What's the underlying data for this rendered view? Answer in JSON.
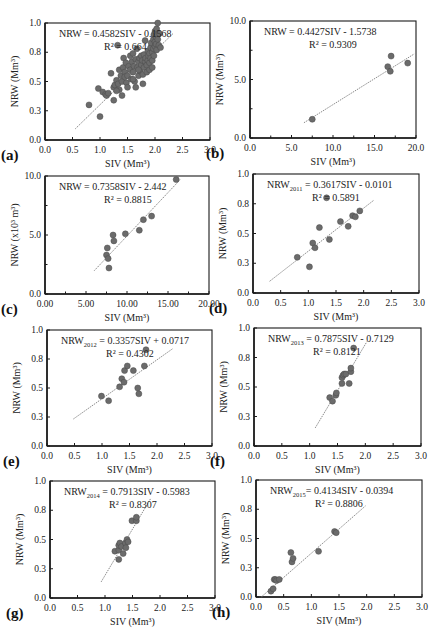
{
  "figure": {
    "style": {
      "point_fill": "#6b6b6b",
      "point_stroke": "#4a4a4a",
      "trend_color": "#8a8a8a",
      "axis_color": "#1a1a1a",
      "text_color": "#222222"
    }
  },
  "chart_data": [
    {
      "panel": "(a)",
      "type": "scatter",
      "title": "",
      "xlabel": "SIV (Mm³)",
      "ylabel": "NRW (Mm³)",
      "xlim": [
        0,
        3.0
      ],
      "ylim": [
        0,
        1.0
      ],
      "xticks": [
        "0.0",
        "0.5",
        "1.0",
        "1.5",
        "2.0",
        "2.5",
        "3.0"
      ],
      "yticks": [
        "0.0",
        "0.3",
        "0.5",
        "0.8",
        "1.0"
      ],
      "grid": false,
      "equation": {
        "lhs": "NRW",
        "sub": "",
        "rhs": " = 0.4582SIV - 0.1568"
      },
      "r2": "R² = 0.664",
      "trendline": {
        "slope": 0.4582,
        "intercept": -0.1568,
        "x_range": [
          0.55,
          2.33
        ]
      },
      "points": [
        [
          0.8,
          0.3
        ],
        [
          1.0,
          0.2
        ],
        [
          0.97,
          0.44
        ],
        [
          1.05,
          0.41
        ],
        [
          1.1,
          0.39
        ],
        [
          1.12,
          0.38
        ],
        [
          1.15,
          0.4
        ],
        [
          1.2,
          0.57
        ],
        [
          1.25,
          0.34
        ],
        [
          1.25,
          0.45
        ],
        [
          1.27,
          0.47
        ],
        [
          1.3,
          0.51
        ],
        [
          1.32,
          0.81
        ],
        [
          1.33,
          0.48
        ],
        [
          1.35,
          0.6
        ],
        [
          1.35,
          0.43
        ],
        [
          1.38,
          0.55
        ],
        [
          1.4,
          0.5
        ],
        [
          1.4,
          0.38
        ],
        [
          1.42,
          0.62
        ],
        [
          1.43,
          0.7
        ],
        [
          1.45,
          0.58
        ],
        [
          1.45,
          0.54
        ],
        [
          1.47,
          0.66
        ],
        [
          1.48,
          0.49
        ],
        [
          1.5,
          0.55
        ],
        [
          1.52,
          0.63
        ],
        [
          1.55,
          0.72
        ],
        [
          1.55,
          0.6
        ],
        [
          1.57,
          0.52
        ],
        [
          1.58,
          0.67
        ],
        [
          1.6,
          0.58
        ],
        [
          1.6,
          0.74
        ],
        [
          1.62,
          0.63
        ],
        [
          1.63,
          0.5
        ],
        [
          1.65,
          0.69
        ],
        [
          1.65,
          0.45
        ],
        [
          1.67,
          0.78
        ],
        [
          1.68,
          0.62
        ],
        [
          1.7,
          0.55
        ],
        [
          1.7,
          0.67
        ],
        [
          1.72,
          0.7
        ],
        [
          1.73,
          0.59
        ],
        [
          1.75,
          0.64
        ],
        [
          1.75,
          0.72
        ],
        [
          1.77,
          0.68
        ],
        [
          1.78,
          0.56
        ],
        [
          1.78,
          0.48
        ],
        [
          1.8,
          0.73
        ],
        [
          1.8,
          0.62
        ],
        [
          1.82,
          0.85
        ],
        [
          1.82,
          0.67
        ],
        [
          1.83,
          0.7
        ],
        [
          1.85,
          0.64
        ],
        [
          1.85,
          0.58
        ],
        [
          1.87,
          0.76
        ],
        [
          1.87,
          0.68
        ],
        [
          1.88,
          0.72
        ],
        [
          1.9,
          0.74
        ],
        [
          1.9,
          0.66
        ],
        [
          1.9,
          0.6
        ],
        [
          1.92,
          0.79
        ],
        [
          1.92,
          0.7
        ],
        [
          1.93,
          0.83
        ],
        [
          1.95,
          0.75
        ],
        [
          1.95,
          0.68
        ],
        [
          1.97,
          0.86
        ],
        [
          1.97,
          0.78
        ],
        [
          1.98,
          0.9
        ],
        [
          1.98,
          0.72
        ],
        [
          2.0,
          0.84
        ],
        [
          2.0,
          0.8
        ],
        [
          2.0,
          0.93
        ],
        [
          2.02,
          0.88
        ],
        [
          2.02,
          0.82
        ],
        [
          2.03,
          0.95
        ],
        [
          2.03,
          0.77
        ],
        [
          2.05,
          0.9
        ],
        [
          2.05,
          0.86
        ],
        [
          2.05,
          1.0
        ],
        [
          2.07,
          0.81
        ],
        [
          2.08,
          0.91
        ],
        [
          2.1,
          0.79
        ],
        [
          1.95,
          0.62
        ],
        [
          1.6,
          0.52
        ],
        [
          1.5,
          0.45
        ],
        [
          1.3,
          0.42
        ],
        [
          1.7,
          0.6
        ]
      ],
      "frame": {
        "left": 45,
        "top": 23,
        "right": 210,
        "bottom": 140
      }
    },
    {
      "panel": "(b)",
      "type": "scatter",
      "xlabel": "SIV (Mm³)",
      "ylabel": "NRW (Mm³)",
      "xlim": [
        0,
        20.0
      ],
      "ylim": [
        0,
        10.0
      ],
      "xticks": [
        "0.0",
        "5.0",
        "10.0",
        "15.0",
        "20.0"
      ],
      "yticks": [
        "0.0",
        "5.0",
        "10.0"
      ],
      "grid": false,
      "equation": {
        "lhs": "NRW",
        "sub": "",
        "rhs": " = 0.4427SIV - 1.5738"
      },
      "r2": "R² = 0.9309",
      "trendline": {
        "slope": 0.4427,
        "intercept": -1.5738,
        "x_range": [
          6.5,
          19.8
        ]
      },
      "points": [
        [
          7.5,
          1.6
        ],
        [
          16.6,
          6.1
        ],
        [
          17.0,
          7.0
        ],
        [
          16.9,
          5.7
        ],
        [
          19.0,
          6.4
        ]
      ],
      "frame": {
        "left": 250,
        "top": 21,
        "right": 416,
        "bottom": 138
      }
    },
    {
      "panel": "(c)",
      "type": "scatter",
      "xlabel": "SIV (Mm³)",
      "ylabel": "NRW (x10³ m³)",
      "xlim": [
        0,
        20.0
      ],
      "ylim": [
        0,
        10.0
      ],
      "xticks": [
        "0.00",
        "5.00",
        "10.00",
        "15.00",
        "20.00"
      ],
      "yticks": [
        "0.0",
        "5.0",
        "10.0"
      ],
      "grid": false,
      "equation": {
        "lhs": "NRW",
        "sub": "",
        "rhs": " = 0.7358SIV - 2.442"
      },
      "r2": "R² = 0.8815",
      "trendline": {
        "slope": 0.7358,
        "intercept": -2.442,
        "x_range": [
          6.0,
          16.5
        ]
      },
      "points": [
        [
          7.6,
          3.9
        ],
        [
          7.5,
          3.3
        ],
        [
          7.7,
          3.0
        ],
        [
          7.8,
          2.2
        ],
        [
          8.3,
          5.0
        ],
        [
          8.4,
          4.5
        ],
        [
          9.8,
          5.1
        ],
        [
          11.5,
          5.4
        ],
        [
          12.0,
          6.3
        ],
        [
          13.0,
          6.6
        ],
        [
          16.0,
          9.7
        ]
      ],
      "frame": {
        "left": 45,
        "top": 176,
        "right": 209,
        "bottom": 294
      }
    },
    {
      "panel": "(d)",
      "type": "scatter",
      "xlabel": "SIV (Mm³)",
      "ylabel": "NRW (Mm³)",
      "xlim": [
        0,
        3.0
      ],
      "ylim": [
        0,
        1.0
      ],
      "xticks": [
        "0.0",
        "0.5",
        "1.0",
        "1.5",
        "2.0",
        "2.5",
        "3.0"
      ],
      "yticks": [
        "0.0",
        "0.3",
        "0.5",
        "0.8",
        "1.0"
      ],
      "grid": false,
      "equation": {
        "lhs": "NRW",
        "sub": "2011",
        "rhs": " = 0.3617SIV - 0.0101"
      },
      "r2": "R² = 0.5891",
      "trendline": {
        "slope": 0.3617,
        "intercept": -0.0101,
        "x_range": [
          0.3,
          2.18
        ]
      },
      "points": [
        [
          0.8,
          0.3
        ],
        [
          1.02,
          0.22
        ],
        [
          1.08,
          0.42
        ],
        [
          1.12,
          0.38
        ],
        [
          1.2,
          0.55
        ],
        [
          1.33,
          0.8
        ],
        [
          1.38,
          0.45
        ],
        [
          1.58,
          0.6
        ],
        [
          1.72,
          0.56
        ],
        [
          1.8,
          0.65
        ],
        [
          1.85,
          0.64
        ],
        [
          1.93,
          0.69
        ]
      ],
      "frame": {
        "left": 253,
        "top": 174,
        "right": 419,
        "bottom": 293
      }
    },
    {
      "panel": "(e)",
      "type": "scatter",
      "xlabel": "SIV (Mm³)",
      "ylabel": "NRW (Mm³)",
      "xlim": [
        0,
        3.0
      ],
      "ylim": [
        0,
        1.0
      ],
      "xticks": [
        "0.0",
        "0.5",
        "1.0",
        "1.5",
        "2.0",
        "2.5",
        "3.0"
      ],
      "yticks": [
        "0.0",
        "0.3",
        "0.5",
        "0.8",
        "1.0"
      ],
      "grid": false,
      "equation": {
        "lhs": "NRW",
        "sub": "2012",
        "rhs": " = 0.3357SIV + 0.0717"
      },
      "r2": "R² = 0.4302",
      "trendline": {
        "slope": 0.3357,
        "intercept": 0.0717,
        "x_range": [
          0.48,
          2.28
        ]
      },
      "points": [
        [
          0.99,
          0.43
        ],
        [
          1.12,
          0.39
        ],
        [
          1.32,
          0.51
        ],
        [
          1.36,
          0.58
        ],
        [
          1.4,
          0.55
        ],
        [
          1.41,
          0.65
        ],
        [
          1.46,
          0.69
        ],
        [
          1.57,
          0.65
        ],
        [
          1.65,
          0.5
        ],
        [
          1.67,
          0.45
        ],
        [
          1.77,
          0.69
        ],
        [
          1.8,
          0.83
        ]
      ],
      "frame": {
        "left": 47,
        "top": 330,
        "right": 212,
        "bottom": 446
      }
    },
    {
      "panel": "(f)",
      "type": "scatter",
      "xlabel": "SIV (Mm³)",
      "ylabel": "NRW (Mm³)",
      "xlim": [
        0,
        3.0
      ],
      "ylim": [
        0,
        1.0
      ],
      "xticks": [
        "0.0",
        "0.5",
        "1.0",
        "1.5",
        "2.0",
        "2.5",
        "3.0"
      ],
      "yticks": [
        "0.0",
        "0.3",
        "0.5",
        "0.8",
        "1.0"
      ],
      "grid": false,
      "equation": {
        "lhs": "NRW",
        "sub": "2013",
        "rhs": " = 0.7875SIV - 0.7129"
      },
      "r2": "R² = 0.8121",
      "trendline": {
        "slope": 0.7875,
        "intercept": -0.7129,
        "x_range": [
          1.1,
          2.03
        ]
      },
      "points": [
        [
          1.36,
          0.41
        ],
        [
          1.41,
          0.38
        ],
        [
          1.47,
          0.43
        ],
        [
          1.48,
          0.45
        ],
        [
          1.58,
          0.53
        ],
        [
          1.58,
          0.58
        ],
        [
          1.6,
          0.6
        ],
        [
          1.62,
          0.61
        ],
        [
          1.65,
          0.61
        ],
        [
          1.71,
          0.53
        ],
        [
          1.74,
          0.63
        ],
        [
          1.74,
          0.66
        ],
        [
          1.79,
          0.83
        ]
      ],
      "frame": {
        "left": 254,
        "top": 328,
        "right": 421,
        "bottom": 446
      }
    },
    {
      "panel": "(g)",
      "type": "scatter",
      "xlabel": "SIV (Mm³)",
      "ylabel": "NRW (Mm³)",
      "xlim": [
        0,
        3.0
      ],
      "ylim": [
        0,
        1.0
      ],
      "xticks": [
        "0.0",
        "0.5",
        "1.0",
        "1.5",
        "2.0",
        "2.5",
        "3.0"
      ],
      "yticks": [
        "0.0",
        "0.3",
        "0.5",
        "0.8",
        "1.0"
      ],
      "grid": false,
      "equation": {
        "lhs": "NRW",
        "sub": "2014",
        "rhs": " = 0.7913SIV - 0.5983"
      },
      "r2": "R² = 0.8307",
      "trendline": {
        "slope": 0.7913,
        "intercept": -0.5983,
        "x_range": [
          0.93,
          1.83
        ]
      },
      "points": [
        [
          1.18,
          0.4
        ],
        [
          1.25,
          0.33
        ],
        [
          1.25,
          0.41
        ],
        [
          1.25,
          0.45
        ],
        [
          1.27,
          0.47
        ],
        [
          1.3,
          0.44
        ],
        [
          1.33,
          0.38
        ],
        [
          1.37,
          0.47
        ],
        [
          1.38,
          0.43
        ],
        [
          1.4,
          0.5
        ],
        [
          1.42,
          0.48
        ],
        [
          1.49,
          0.66
        ],
        [
          1.57,
          0.66
        ],
        [
          1.57,
          0.69
        ]
      ],
      "frame": {
        "left": 50,
        "top": 481,
        "right": 215,
        "bottom": 598
      }
    },
    {
      "panel": "(h)",
      "type": "scatter",
      "xlabel": "SIV (Mm³)",
      "ylabel": "NRW (Mm³)",
      "xlim": [
        0,
        3.0
      ],
      "ylim": [
        0,
        1.0
      ],
      "xticks": [
        "0.0",
        "0.5",
        "1.0",
        "1.5",
        "2.0",
        "2.5",
        "3.0"
      ],
      "yticks": [
        "0.0",
        "0.3",
        "0.5",
        "0.8",
        "1.0"
      ],
      "grid": false,
      "equation": {
        "lhs": "NRW",
        "sub": "2015",
        "rhs": "= 0.4134SIV - 0.0394"
      },
      "r2": "R² = 0.8806",
      "trendline": {
        "slope": 0.4134,
        "intercept": -0.0394,
        "x_range": [
          0.1,
          1.98
        ]
      },
      "points": [
        [
          0.27,
          0.05
        ],
        [
          0.31,
          0.07
        ],
        [
          0.33,
          0.15
        ],
        [
          0.35,
          0.15
        ],
        [
          0.37,
          0.14
        ],
        [
          0.42,
          0.15
        ],
        [
          0.63,
          0.38
        ],
        [
          0.65,
          0.3
        ],
        [
          0.67,
          0.33
        ],
        [
          1.13,
          0.39
        ],
        [
          1.42,
          0.56
        ],
        [
          1.45,
          0.55
        ]
      ],
      "frame": {
        "left": 256,
        "top": 480,
        "right": 422,
        "bottom": 597
      }
    }
  ]
}
